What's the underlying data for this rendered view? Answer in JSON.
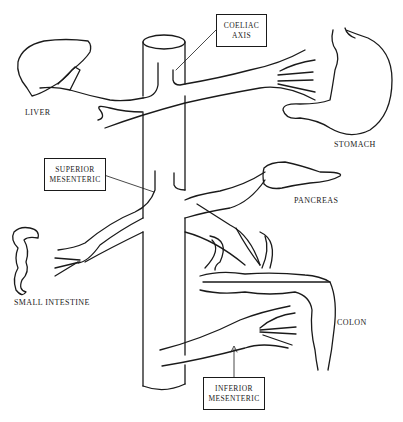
{
  "diagram": {
    "callouts": {
      "coeliac": {
        "line1": "COELIAC",
        "line2": "AXIS"
      },
      "superior": {
        "line1": "SUPERIOR",
        "line2": "MESENTERIC"
      },
      "inferior": {
        "line1": "INFERIOR",
        "line2": "MESENTERIC"
      }
    },
    "organs": {
      "liver": "LIVER",
      "stomach": "STOMACH",
      "pancreas": "PANCREAS",
      "small_intestine": "SMALL INTESTINE",
      "colon": "COLON"
    },
    "colors": {
      "ink": "#1a1a1a",
      "background": "#ffffff"
    }
  }
}
